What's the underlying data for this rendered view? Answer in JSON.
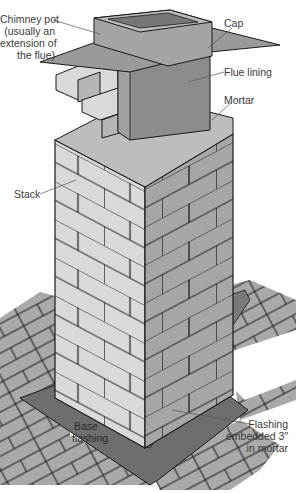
{
  "figure": {
    "labels": {
      "chimney_pot": [
        "Chimney pot",
        "(usually an",
        "extension of",
        "the flue)"
      ],
      "cap": "Cap",
      "flue_lining": "Flue lining",
      "mortar": "Mortar",
      "stack": "Stack",
      "base_flashing": [
        "Base",
        "flashing"
      ],
      "flashing_embedded": [
        "Flashing",
        "embedded 3\"",
        "in mortar"
      ]
    },
    "colors": {
      "brick_light": "#d9d9d9",
      "brick_dark": "#a6a6a6",
      "flue": "#8c8c8c",
      "mortar_top": "#bdbdbd",
      "shingle": "#a9a9a9",
      "flashing": "#6e6e6e",
      "outline": "#1a1a1a",
      "label_text": "#3a3a3a"
    }
  }
}
